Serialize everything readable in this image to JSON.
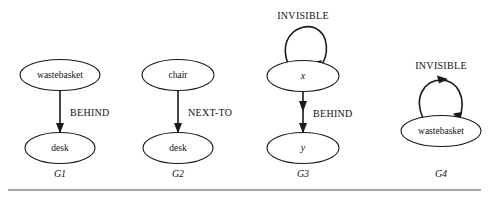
{
  "figure": {
    "background_color": "#ffffff",
    "line_color": "#1a1a1a",
    "rule_color": "#4a4a4a",
    "graphs": [
      {
        "caption": "G1",
        "caption_x": 60,
        "caption_y": 177,
        "nodes": [
          {
            "label": "wastebasket",
            "style": "word",
            "cx": 60,
            "cy": 75,
            "rx": 40,
            "ry": 15.5
          },
          {
            "label": "desk",
            "style": "word",
            "cx": 60,
            "cy": 148,
            "rx": 35,
            "ry": 15.5
          }
        ],
        "edge": {
          "label": "BEHIND",
          "label_x": 70,
          "label_y": 112,
          "x": 60,
          "y1": 90.5,
          "y2": 132.5,
          "arrowheads": [
            132.5
          ]
        },
        "loop": null
      },
      {
        "caption": "G2",
        "caption_x": 178,
        "caption_y": 177,
        "nodes": [
          {
            "label": "chair",
            "style": "word",
            "cx": 178,
            "cy": 75,
            "rx": 36,
            "ry": 15.5
          },
          {
            "label": "desk",
            "style": "word",
            "cx": 178,
            "cy": 148,
            "rx": 35,
            "ry": 15.5
          }
        ],
        "edge": {
          "label": "NEXT-TO",
          "label_x": 188,
          "label_y": 112,
          "x": 178,
          "y1": 90.5,
          "y2": 132.5,
          "arrowheads": [
            132.5
          ]
        },
        "loop": null
      },
      {
        "caption": "G3",
        "caption_x": 303,
        "caption_y": 177,
        "nodes": [
          {
            "label": "x",
            "style": "variable",
            "cx": 303,
            "cy": 76,
            "rx": 36,
            "ry": 15.5
          },
          {
            "label": "y",
            "style": "variable",
            "cx": 303,
            "cy": 148,
            "rx": 36,
            "ry": 15.5
          }
        ],
        "edge": {
          "label": "BEHIND",
          "label_x": 313,
          "label_y": 113,
          "x": 303,
          "y1": 91.5,
          "y2": 132.5,
          "arrowheads": [
            110,
            132.5
          ]
        },
        "loop": {
          "label": "INVISIBLE",
          "label_x": 303,
          "label_y": 16,
          "node_cx": 303,
          "node_cy": 76,
          "node_rx": 36,
          "node_ry": 15.5,
          "arrowheads": [
            "bottom-right"
          ]
        }
      },
      {
        "caption": "G4",
        "caption_x": 441,
        "caption_y": 177,
        "nodes": [
          {
            "label": "wastebasket",
            "style": "word",
            "cx": 441,
            "cy": 131,
            "rx": 40,
            "ry": 15.5
          }
        ],
        "edge": null,
        "loop": {
          "label": "INVISIBLE",
          "label_x": 441,
          "label_y": 66,
          "node_cx": 441,
          "node_cy": 131,
          "node_rx": 40,
          "node_ry": 15.5,
          "arrowheads": [
            "top",
            "bottom-right"
          ]
        }
      }
    ],
    "rule": {
      "x1": 8,
      "x2": 481,
      "y": 190
    }
  }
}
